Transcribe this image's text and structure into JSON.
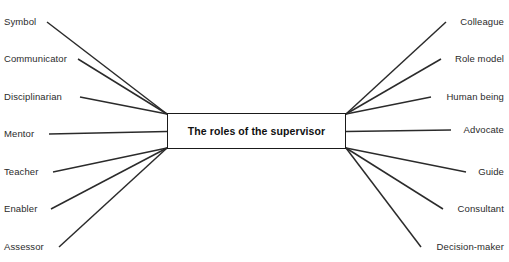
{
  "diagram": {
    "type": "spider-mind-map",
    "center": {
      "title": "The roles of the supervisor"
    },
    "colors": {
      "line": "#2b2b2b",
      "box_border": "#1a1a1a",
      "text": "#2b2b2b",
      "background": "#ffffff"
    },
    "left_branches": [
      {
        "label": "Symbol",
        "y": 22,
        "text_end_x": 43,
        "anchor": "top-left"
      },
      {
        "label": "Communicator",
        "y": 59,
        "text_end_x": 74,
        "anchor": "top-left"
      },
      {
        "label": "Disciplinarian",
        "y": 97,
        "text_end_x": 76,
        "anchor": "top-left"
      },
      {
        "label": "Mentor",
        "y": 134,
        "text_end_x": 45,
        "anchor": "left-mid"
      },
      {
        "label": "Teacher",
        "y": 172,
        "text_end_x": 49,
        "anchor": "bottom-left"
      },
      {
        "label": "Enabler",
        "y": 209,
        "text_end_x": 47,
        "anchor": "bottom-left"
      },
      {
        "label": "Assessor",
        "y": 247,
        "text_end_x": 55,
        "anchor": "bottom-left"
      }
    ],
    "right_branches": [
      {
        "label": "Colleague",
        "y": 22,
        "text_start_x": 450,
        "anchor": "top-right"
      },
      {
        "label": "Role model",
        "y": 59,
        "text_start_x": 445,
        "anchor": "top-right"
      },
      {
        "label": "Human being",
        "y": 97,
        "text_start_x": 435,
        "anchor": "top-right"
      },
      {
        "label": "Advocate",
        "y": 130,
        "text_start_x": 455,
        "anchor": "right-mid"
      },
      {
        "label": "Guide",
        "y": 172,
        "text_start_x": 470,
        "anchor": "bottom-right"
      },
      {
        "label": "Consultant",
        "y": 209,
        "text_start_x": 447,
        "anchor": "bottom-right"
      },
      {
        "label": "Decision-maker",
        "y": 247,
        "text_start_x": 425,
        "anchor": "bottom-right"
      }
    ],
    "geometry": {
      "box_left": 167,
      "box_right": 346,
      "box_top": 113,
      "box_bottom": 149,
      "box_mid_y": 131.5
    }
  }
}
